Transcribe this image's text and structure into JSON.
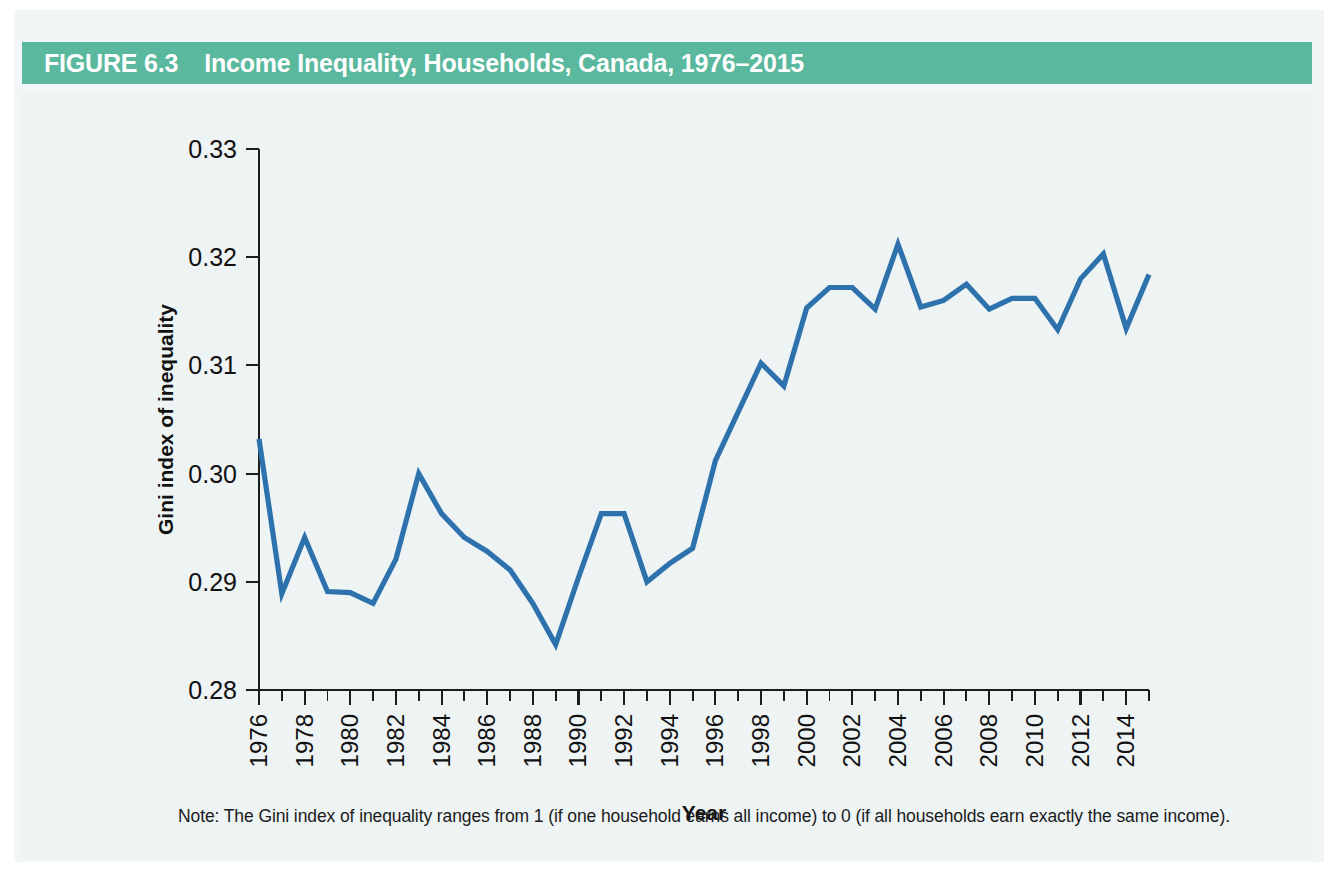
{
  "figure": {
    "number_label": "FIGURE 6.3",
    "title": "Income Inequality, Households, Canada, 1976–2015",
    "header_color": "#5ab89e",
    "panel_color": "#eef3f4",
    "note": "Note: The Gini index of inequality ranges from 1 (if one household earns all income) to 0 (if all households earn exactly the same income)."
  },
  "chart_data": {
    "type": "line",
    "title": "Income Inequality, Households, Canada, 1976–2015",
    "xlabel": "Year",
    "ylabel": "Gini index of inequality",
    "xlim": [
      1976,
      2015
    ],
    "ylim": [
      0.28,
      0.33
    ],
    "grid": false,
    "legend": "none",
    "line_color": "#2d71ad",
    "ytick_labels": [
      "0.28",
      "0.29",
      "0.30",
      "0.31",
      "0.32",
      "0.33"
    ],
    "ytick_values": [
      0.28,
      0.29,
      0.3,
      0.31,
      0.32,
      0.33
    ],
    "xtick_labels": [
      "1976",
      "1978",
      "1980",
      "1982",
      "1984",
      "1986",
      "1988",
      "1990",
      "1992",
      "1994",
      "1996",
      "1998",
      "2000",
      "2002",
      "2004",
      "2006",
      "2008",
      "2010",
      "2012",
      "2014"
    ],
    "xtick_labeled_values": [
      1976,
      1978,
      1980,
      1982,
      1984,
      1986,
      1988,
      1990,
      1992,
      1994,
      1996,
      1998,
      2000,
      2002,
      2004,
      2006,
      2008,
      2010,
      2012,
      2014
    ],
    "x": [
      1976,
      1977,
      1978,
      1979,
      1980,
      1981,
      1982,
      1983,
      1984,
      1985,
      1986,
      1987,
      1988,
      1989,
      1990,
      1991,
      1992,
      1993,
      1994,
      1995,
      1996,
      1997,
      1998,
      1999,
      2000,
      2001,
      2002,
      2003,
      2004,
      2005,
      2006,
      2007,
      2008,
      2009,
      2010,
      2011,
      2012,
      2013,
      2014,
      2015
    ],
    "values": [
      0.3032,
      0.2889,
      0.2941,
      0.2891,
      0.289,
      0.288,
      0.2921,
      0.3,
      0.2963,
      0.2941,
      0.2928,
      0.2911,
      0.288,
      0.2842,
      0.2904,
      0.2963,
      0.2963,
      0.29,
      0.2917,
      0.2931,
      0.3012,
      0.3057,
      0.3102,
      0.3081,
      0.3153,
      0.3172,
      0.3172,
      0.3152,
      0.3212,
      0.3154,
      0.316,
      0.3175,
      0.3152,
      0.3162,
      0.3162,
      0.3133,
      0.318,
      0.3203,
      0.3134,
      0.3184
    ]
  }
}
